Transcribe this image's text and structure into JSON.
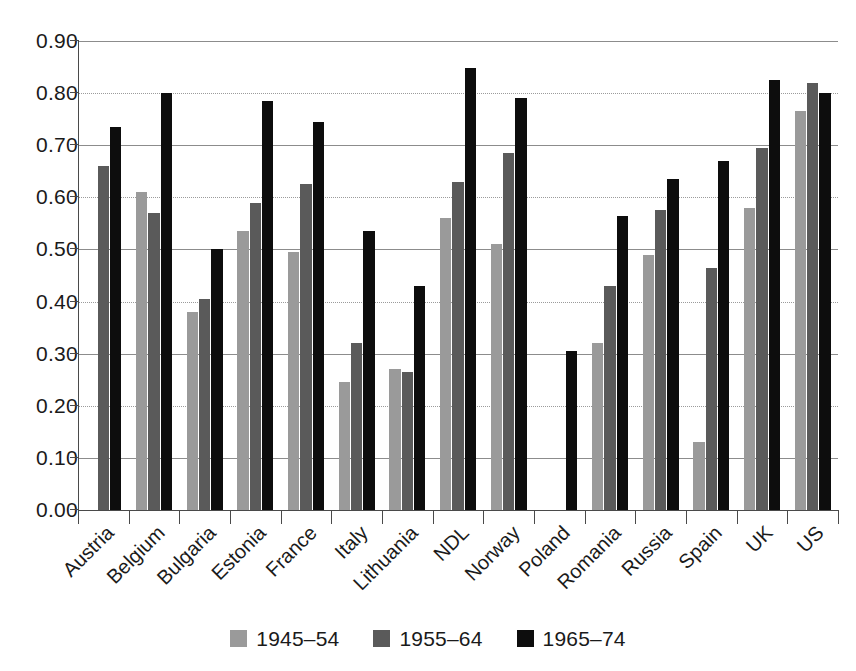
{
  "chart_data": {
    "type": "bar",
    "title": "",
    "subtitle": "",
    "xlabel": "",
    "ylabel": "",
    "ylim": [
      0.0,
      0.9
    ],
    "ytick_labels": [
      "0.90",
      "0.80",
      "0.70",
      "0.60",
      "0.50",
      "0.40",
      "0.30",
      "0.20",
      "0.10",
      "0.00"
    ],
    "ytick_values": [
      0.9,
      0.8,
      0.7,
      0.6,
      0.5,
      0.4,
      0.3,
      0.2,
      0.1,
      0.0
    ],
    "grid": true,
    "legend_position": "bottom-center",
    "categories": [
      "Austria",
      "Belgium",
      "Bulgaria",
      "Estonia",
      "France",
      "Italy",
      "Lithuania",
      "NDL",
      "Norway",
      "Poland",
      "Romania",
      "Russia",
      "Spain",
      "UK",
      "US"
    ],
    "series": [
      {
        "name": "1945–54",
        "color": "#9a9a9a",
        "values": [
          null,
          0.61,
          0.38,
          0.535,
          0.495,
          0.245,
          0.27,
          0.56,
          0.51,
          null,
          0.32,
          0.49,
          0.13,
          0.58,
          0.765
        ]
      },
      {
        "name": "1955–64",
        "color": "#5a5a5a",
        "values": [
          0.66,
          0.57,
          0.405,
          0.59,
          0.625,
          0.32,
          0.265,
          0.63,
          0.685,
          null,
          0.43,
          0.575,
          0.465,
          0.695,
          0.82
        ]
      },
      {
        "name": "1965–74",
        "color": "#0d0d0d",
        "values": [
          0.735,
          0.8,
          0.5,
          0.785,
          0.745,
          0.535,
          0.43,
          0.848,
          0.79,
          0.305,
          0.565,
          0.635,
          0.67,
          0.825,
          0.8
        ]
      }
    ]
  },
  "legend": {
    "items": [
      {
        "label": "1945–54",
        "color": "#9a9a9a"
      },
      {
        "label": "1955–64",
        "color": "#5a5a5a"
      },
      {
        "label": "1965–74",
        "color": "#0d0d0d"
      }
    ]
  },
  "colors": {
    "series_1945_54": "#9a9a9a",
    "series_1955_64": "#5a5a5a",
    "series_1965_74": "#0d0d0d",
    "axis": "#4a4a4a",
    "grid": "#8c8c8c",
    "background": "#ffffff",
    "text": "#1a1a1a"
  }
}
